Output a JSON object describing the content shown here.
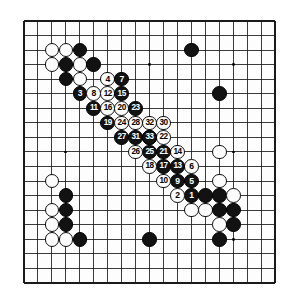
{
  "figure": {
    "type": "go-game-diagram",
    "board_size": 19,
    "background_color": "#ffffff",
    "board_color": "#fdfdfd",
    "line_color": "#1a1a1a",
    "black_color": "#121212",
    "white_color": "#fcfcfc",
    "move_number_range": "1-33",
    "black_plays": "odd",
    "white_plays": "even"
  },
  "geometry": {
    "board_left": 24,
    "board_top": 21,
    "board_right": 275,
    "board_bottom": 283,
    "cell_w": 13.95,
    "cell_h": 14.55,
    "stone_diameter": 14.6,
    "number_font_size": 8.6,
    "star_radius": 1.4
  },
  "star_points": [
    {
      "col": 3,
      "row": 3
    },
    {
      "col": 9,
      "row": 3
    },
    {
      "col": 15,
      "row": 3
    },
    {
      "col": 3,
      "row": 9
    },
    {
      "col": 9,
      "row": 9
    },
    {
      "col": 15,
      "row": 9
    },
    {
      "col": 3,
      "row": 15
    },
    {
      "col": 9,
      "row": 15
    },
    {
      "col": 15,
      "row": 15
    }
  ],
  "plain_stones": [
    {
      "col": 2,
      "row": 2,
      "color": "white",
      "name": "white-stone-c2-r2"
    },
    {
      "col": 3,
      "row": 2,
      "color": "white",
      "name": "white-stone-c3-r2"
    },
    {
      "col": 4,
      "row": 2,
      "color": "black",
      "name": "black-stone-c4-r2"
    },
    {
      "col": 2,
      "row": 3,
      "color": "white",
      "name": "white-stone-c2-r3"
    },
    {
      "col": 3,
      "row": 3,
      "color": "black",
      "name": "black-stone-c3-r3"
    },
    {
      "col": 4,
      "row": 3,
      "color": "white",
      "name": "white-stone-c4-r3"
    },
    {
      "col": 5,
      "row": 3,
      "color": "black",
      "name": "black-stone-c5-r3"
    },
    {
      "col": 3,
      "row": 4,
      "color": "black",
      "name": "black-stone-c3-r4"
    },
    {
      "col": 4,
      "row": 4,
      "color": "white",
      "name": "white-stone-c4-r4"
    },
    {
      "col": 12,
      "row": 2,
      "color": "black",
      "name": "black-stone-c12-r2"
    },
    {
      "col": 14,
      "row": 5,
      "color": "black",
      "name": "black-stone-c14-r5"
    },
    {
      "col": 14,
      "row": 9,
      "color": "white",
      "name": "white-stone-c14-r9"
    },
    {
      "col": 14,
      "row": 11,
      "color": "white",
      "name": "white-stone-c14-r11"
    },
    {
      "col": 14,
      "row": 12,
      "color": "black",
      "name": "black-stone-c14-r12"
    },
    {
      "col": 15,
      "row": 12,
      "color": "white",
      "name": "white-stone-c15-r12"
    },
    {
      "col": 12,
      "row": 13,
      "color": "white",
      "name": "white-stone-c12-r13"
    },
    {
      "col": 13,
      "row": 13,
      "color": "white",
      "name": "white-stone-c13-r13"
    },
    {
      "col": 14,
      "row": 13,
      "color": "black",
      "name": "black-stone-c14-r13"
    },
    {
      "col": 15,
      "row": 13,
      "color": "black",
      "name": "black-stone-c15-r13"
    },
    {
      "col": 14,
      "row": 14,
      "color": "white",
      "name": "white-stone-c14-r14"
    },
    {
      "col": 15,
      "row": 14,
      "color": "black",
      "name": "black-stone-c15-r14"
    },
    {
      "col": 14,
      "row": 15,
      "color": "black",
      "name": "black-stone-c14-r15"
    },
    {
      "col": 13,
      "row": 12,
      "color": "black",
      "name": "black-stone-c13-r12"
    },
    {
      "col": 2,
      "row": 11,
      "color": "white",
      "name": "white-stone-c2-r11"
    },
    {
      "col": 3,
      "row": 12,
      "color": "black",
      "name": "black-stone-c3-r12"
    },
    {
      "col": 2,
      "row": 13,
      "color": "white",
      "name": "white-stone-c2-r13"
    },
    {
      "col": 3,
      "row": 13,
      "color": "black",
      "name": "black-stone-c3-r13"
    },
    {
      "col": 2,
      "row": 14,
      "color": "white",
      "name": "white-stone-c2-r14"
    },
    {
      "col": 3,
      "row": 14,
      "color": "black",
      "name": "black-stone-c3-r14"
    },
    {
      "col": 2,
      "row": 15,
      "color": "white",
      "name": "white-stone-c2-r15"
    },
    {
      "col": 3,
      "row": 15,
      "color": "white",
      "name": "white-stone-c3-r15"
    },
    {
      "col": 4,
      "row": 15,
      "color": "black",
      "name": "black-stone-c4-r15"
    },
    {
      "col": 9,
      "row": 15,
      "color": "black",
      "name": "black-stone-c9-r15"
    }
  ],
  "numbered_moves": [
    {
      "n": 1,
      "col": 12,
      "row": 12,
      "color": "black"
    },
    {
      "n": 2,
      "col": 11,
      "row": 12,
      "color": "white"
    },
    {
      "n": 3,
      "col": 4,
      "row": 5,
      "color": "black"
    },
    {
      "n": 4,
      "col": 6,
      "row": 4,
      "color": "white"
    },
    {
      "n": 5,
      "col": 12,
      "row": 11,
      "color": "black"
    },
    {
      "n": 6,
      "col": 12,
      "row": 10,
      "color": "white"
    },
    {
      "n": 7,
      "col": 7,
      "row": 4,
      "color": "black"
    },
    {
      "n": 8,
      "col": 5,
      "row": 5,
      "color": "white"
    },
    {
      "n": 9,
      "col": 11,
      "row": 11,
      "color": "black"
    },
    {
      "n": 10,
      "col": 10,
      "row": 11,
      "color": "white"
    },
    {
      "n": 11,
      "col": 5,
      "row": 6,
      "color": "black"
    },
    {
      "n": 12,
      "col": 6,
      "row": 5,
      "color": "white"
    },
    {
      "n": 13,
      "col": 11,
      "row": 10,
      "color": "black"
    },
    {
      "n": 14,
      "col": 11,
      "row": 9,
      "color": "white"
    },
    {
      "n": 15,
      "col": 7,
      "row": 5,
      "color": "black"
    },
    {
      "n": 16,
      "col": 6,
      "row": 6,
      "color": "white"
    },
    {
      "n": 17,
      "col": 10,
      "row": 10,
      "color": "black"
    },
    {
      "n": 18,
      "col": 9,
      "row": 10,
      "color": "white"
    },
    {
      "n": 19,
      "col": 6,
      "row": 7,
      "color": "black"
    },
    {
      "n": 20,
      "col": 7,
      "row": 6,
      "color": "white"
    },
    {
      "n": 21,
      "col": 10,
      "row": 9,
      "color": "black"
    },
    {
      "n": 22,
      "col": 10,
      "row": 8,
      "color": "white"
    },
    {
      "n": 23,
      "col": 8,
      "row": 6,
      "color": "black"
    },
    {
      "n": 24,
      "col": 7,
      "row": 7,
      "color": "white"
    },
    {
      "n": 25,
      "col": 9,
      "row": 9,
      "color": "black"
    },
    {
      "n": 26,
      "col": 8,
      "row": 9,
      "color": "white"
    },
    {
      "n": 27,
      "col": 7,
      "row": 8,
      "color": "black"
    },
    {
      "n": 28,
      "col": 8,
      "row": 7,
      "color": "white"
    },
    {
      "n": 29,
      "col": 9,
      "row": 8,
      "color": "black"
    },
    {
      "n": 30,
      "col": 10,
      "row": 7,
      "color": "white"
    },
    {
      "n": 31,
      "col": 8,
      "row": 8,
      "color": "black"
    },
    {
      "n": 32,
      "col": 9,
      "row": 7,
      "color": "white"
    },
    {
      "n": 33,
      "col": 9,
      "row": 8,
      "color": "black"
    }
  ]
}
